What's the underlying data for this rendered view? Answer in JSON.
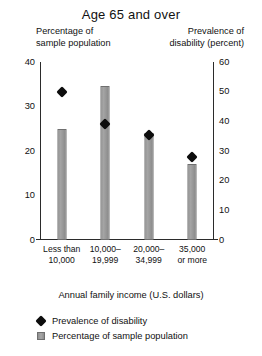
{
  "chart_data": {
    "type": "bar",
    "title": "Age 65 and over",
    "xlabel": "Annual family income (U.S. dollars)",
    "categories": [
      "Less than 10,000",
      "10,000–19,999",
      "20,000–34,999",
      "35,000 or more"
    ],
    "category_lines": [
      [
        "Less than",
        "10,000"
      ],
      [
        "10,000–",
        "19,999"
      ],
      [
        "20,000–",
        "34,999"
      ],
      [
        "35,000",
        "or more"
      ]
    ],
    "grid": false,
    "legend_position": "bottom-left",
    "left_axis": {
      "label": "Percentage of sample population",
      "label_lines": [
        "Percentage of",
        "sample population"
      ],
      "ylim": [
        0,
        40
      ],
      "ticks": [
        0,
        10,
        20,
        30,
        40
      ]
    },
    "right_axis": {
      "label": "Prevalence of disability (percent)",
      "label_lines": [
        "Prevalence of",
        "disability (percent)"
      ],
      "ylim": [
        0,
        60
      ],
      "ticks": [
        0,
        10,
        20,
        30,
        40,
        50,
        60
      ]
    },
    "series": [
      {
        "name": "Percentage of sample population",
        "type": "bar",
        "axis": "left",
        "color": "#9b9b9b",
        "values": [
          25,
          34.5,
          24,
          17
        ]
      },
      {
        "name": "Prevalence of disability",
        "type": "scatter",
        "axis": "right",
        "color": "#0d0d0d",
        "values": [
          50,
          39,
          35.5,
          28
        ]
      }
    ]
  },
  "legend": {
    "items": [
      {
        "label": "Prevalence of disability",
        "marker": "diamond-marker"
      },
      {
        "label": "Percentage of sample population",
        "marker": "bar-swatch"
      }
    ]
  }
}
